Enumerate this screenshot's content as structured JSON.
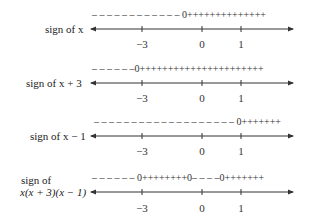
{
  "rows": [
    {
      "label_lines": [
        "sign of x"
      ],
      "signs": "– – – – – – – – – – – – 0++++++++++++++",
      "ticks": [
        "−3",
        "0",
        "1"
      ]
    },
    {
      "label_lines": [
        "sign of x + 3"
      ],
      "signs": "– – – – – –0++++++++++++++++++++++",
      "ticks": [
        "−3",
        "0",
        "1"
      ]
    },
    {
      "label_lines": [
        "sign of x − 1"
      ],
      "signs": "– – – – – – – – – – – – – – – – – – – 0+++++++",
      "ticks": [
        "−3",
        "0",
        "1"
      ]
    },
    {
      "label_lines": [
        "sign of",
        "x(x + 3)(x − 1)"
      ],
      "signs": "– – – – – – 0++++++++0– – – –0+++++++",
      "ticks": [
        "−3",
        "0",
        "1"
      ]
    }
  ],
  "axis": {
    "tick_values": [
      -3,
      0,
      1
    ],
    "critical_points": [
      -3,
      0,
      1
    ]
  }
}
